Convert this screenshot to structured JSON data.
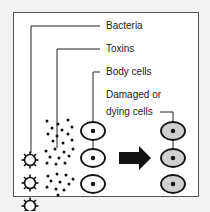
{
  "diagram": {
    "labels": {
      "bacteria": "Bacteria",
      "toxins": "Toxins",
      "body_cells": "Body cells",
      "damaged_line1": "Damaged or",
      "damaged_line2": "dying cells"
    },
    "rows": 3,
    "arrow": "right-arrow",
    "colors": {
      "frame": "#555555",
      "background": "#ffffff",
      "page": "#f2f2f2",
      "damaged_cell_fill": "#cfcfcf",
      "ink": "#111111"
    }
  }
}
